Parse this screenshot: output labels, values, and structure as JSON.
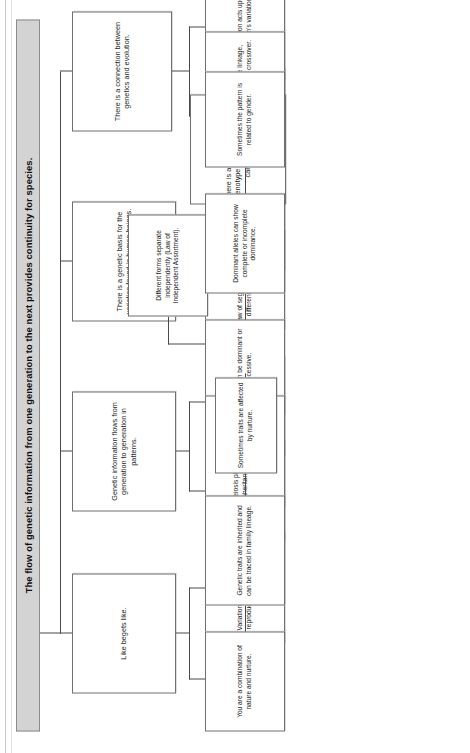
{
  "document": {
    "kind": "concept-map",
    "orientation": "rotated-90-counterclockwise",
    "title": "The flow of genetic information from one generation to the next provides continuity for species.",
    "colors": {
      "title_fill": "#d3d3d3",
      "title_border": "#8a8a8a",
      "node_fill": "#ffffff",
      "node_border": "#6f6f6f",
      "connector": "#4a4a4a",
      "text": "#1c1c1c",
      "page": "#ffffff"
    }
  },
  "nodes": {
    "root": "The flow of genetic information from one generation to the next provides continuity for species.",
    "b1": "There is a connection between genetics and evolution.",
    "b1a": "Natural selection acts upon the population's variation.",
    "b1a1": "Humans also follow the pattern of inheritance.",
    "b1b": "Some traits are discrete, and some are continuous.",
    "b2": "There is a genetic basis for the variation found in human beings.",
    "b2a": "In addition to genetic patterns, other processes result in variety.",
    "b2a1": "Processes include linkage, recombination, and crossover.",
    "b3": "Genetic information flows from generation to generation in patterns.",
    "b3a": "Genetic information combines following certain laws.",
    "b3a1": "Law of segregation states that different forms separate.",
    "b3a1x": "Different forms separate independently (Law of Independent Assortment).",
    "b3a2": "There is a relationship between genotype and phenotypes that can be predicted.",
    "b3b": "Genetic information comes in different forms.",
    "b3b1": "Alleles can be dominant or recessive.",
    "b3b2": "Dominant alleles can show complete or incomplete dominance.",
    "b3b3": "Sometimes the pattern is related to gender.",
    "b4": "Like begets like.",
    "b4a": "Variation is a result of sexual reproduction and mutations.",
    "b4a1": "Meiosis plays a role in determining inheritance by helping to support variation.",
    "b4b": "You are a combination of nature and nurture.",
    "b4b1": "Genetic traits are inherited and can be traced in family lineage.",
    "b4c": "Sometimes traits are affected by nurture."
  }
}
